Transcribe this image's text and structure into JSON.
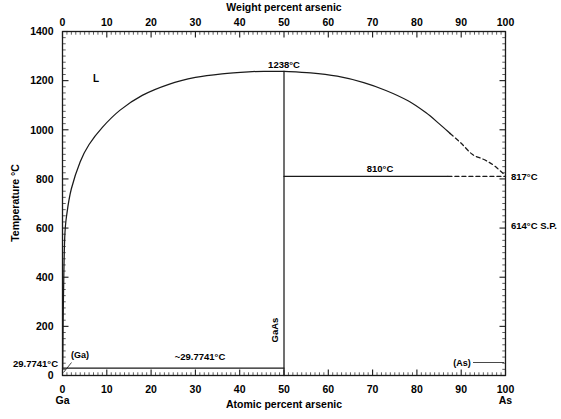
{
  "figure": {
    "title_top_axis": "Weight percent arsenic",
    "title_bottom_axis": "Atomic percent arsenic",
    "title_left_axis": "Temperature °C",
    "background_color": "#ffffff",
    "line_color": "#1a1a1a"
  },
  "axes": {
    "top": {
      "label": "Weight percent arsenic",
      "ticks": [
        "0",
        "10",
        "20",
        "30",
        "40",
        "50",
        "60",
        "70",
        "80",
        "90",
        "100"
      ],
      "values": [
        0,
        10,
        20,
        30,
        40,
        50,
        60,
        70,
        80,
        90,
        100
      ],
      "range": [
        0,
        100
      ]
    },
    "bottom": {
      "label": "Atomic percent arsenic",
      "ticks": [
        "0",
        "10",
        "20",
        "30",
        "40",
        "50",
        "60",
        "70",
        "80",
        "90",
        "100"
      ],
      "values": [
        0,
        10,
        20,
        30,
        40,
        50,
        60,
        70,
        80,
        90,
        100
      ],
      "range": [
        0,
        100
      ]
    },
    "left": {
      "label": "Temperature °C",
      "ticks": [
        "0",
        "200",
        "400",
        "600",
        "800",
        "1000",
        "1200",
        "1400"
      ],
      "values": [
        0,
        200,
        400,
        600,
        800,
        1000,
        1200,
        1400
      ],
      "range": [
        0,
        1400
      ]
    },
    "corner_labels": {
      "bottom_left": "Ga",
      "bottom_right": "As"
    }
  },
  "annotations": {
    "liquid_region": "L",
    "congruent_melt": "1238°C",
    "eutectic_right": "810°C",
    "as_melt": "817°C",
    "sublimation_point": "614°C S.P.",
    "ga_eutectic_axis": "29.7741°C",
    "ga_eutectic_line": "~29.7741°C",
    "compound": "GaAs",
    "ga_phase": "(Ga)",
    "as_phase": "(As)"
  },
  "chart_data": {
    "type": "line",
    "xlabel": "Atomic percent arsenic",
    "ylabel": "Temperature °C",
    "xlim": [
      0,
      100
    ],
    "ylim": [
      0,
      1400
    ],
    "grid": false,
    "legend": "none",
    "secondary_xlabel": "Weight percent arsenic",
    "secondary_xlim": [
      0,
      100
    ],
    "series": [
      {
        "name": "Liquidus (Ga-rich, solid)",
        "style": "solid",
        "x": [
          0.05,
          0.2,
          0.5,
          1.0,
          2.0,
          4.0,
          6.0,
          9.0,
          13.0,
          18.0,
          24.0,
          30.0,
          36.0,
          42.0,
          46.0,
          50.0
        ],
        "y": [
          29.8,
          300,
          560,
          660,
          760,
          870,
          940,
          1010,
          1080,
          1140,
          1185,
          1213,
          1228,
          1236,
          1238,
          1238
        ]
      },
      {
        "name": "Liquidus (As-rich, solid)",
        "style": "solid",
        "x": [
          50.0,
          56.0,
          62.0,
          68.0,
          73.0,
          78.0,
          82.0,
          85.0,
          87.5
        ],
        "y": [
          1238,
          1232,
          1218,
          1192,
          1160,
          1118,
          1070,
          1025,
          985
        ]
      },
      {
        "name": "Liquidus (As-rich, extrapolated)",
        "style": "dashed",
        "x": [
          87.5,
          90.0,
          92.5,
          95.0,
          97.0,
          98.5,
          99.5,
          100.0
        ],
        "y": [
          985,
          945,
          900,
          880,
          860,
          838,
          822,
          817
        ]
      },
      {
        "name": "Eutectic horizontal 810 C (solid)",
        "style": "solid",
        "x": [
          50.0,
          87.0
        ],
        "y": [
          810,
          810
        ]
      },
      {
        "name": "Eutectic horizontal 810 C (dashed)",
        "style": "dashed",
        "x": [
          87.0,
          100.0
        ],
        "y": [
          810,
          810
        ]
      },
      {
        "name": "Eutectic horizontal 29.7741 C",
        "style": "solid",
        "x": [
          0.0,
          50.0
        ],
        "y": [
          29.7741,
          29.7741
        ]
      },
      {
        "name": "GaAs stoichiometric line",
        "style": "solid",
        "x": [
          50.0,
          50.0
        ],
        "y": [
          0.0,
          1238
        ]
      }
    ],
    "points": [
      {
        "label": "1238°C",
        "x": 50,
        "y": 1238
      },
      {
        "label": "817°C",
        "x": 100,
        "y": 817
      },
      {
        "label": "810°C",
        "x": 68,
        "y": 810
      },
      {
        "label": "614°C S.P.",
        "x": 100,
        "y": 614
      },
      {
        "label": "29.7741°C",
        "x": 0,
        "y": 29.7741
      }
    ]
  }
}
